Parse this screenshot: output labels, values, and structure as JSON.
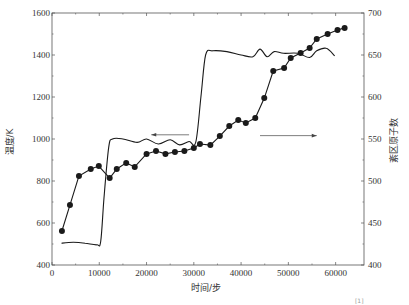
{
  "chart_data": {
    "type": "line",
    "title": "",
    "xlabel": "时间/步",
    "ylabel": "温度/K",
    "y2label": "紊区原子数",
    "xlim": [
      0,
      66000
    ],
    "ylim": [
      400,
      1600
    ],
    "y2lim": [
      400,
      700
    ],
    "x_ticks": [
      0,
      10000,
      20000,
      30000,
      40000,
      50000,
      60000
    ],
    "x_tick_labels": [
      "0",
      "10000",
      "20000",
      "30000",
      "40000",
      "50000",
      "60000"
    ],
    "y_ticks": [
      400,
      600,
      800,
      1000,
      1200,
      1400,
      1600
    ],
    "y_tick_labels": [
      "400",
      "600",
      "800",
      "1000",
      "1200",
      "1400",
      "1600"
    ],
    "y2_ticks": [
      400,
      450,
      500,
      550,
      600,
      650,
      700
    ],
    "y2_tick_labels": [
      "400",
      "450",
      "500",
      "550",
      "600",
      "650",
      "700"
    ],
    "grid": false,
    "legend": "none",
    "series": [
      {
        "name": "温度",
        "axis": "left",
        "style": "line-markers",
        "x": [
          2100,
          3800,
          5700,
          8200,
          9900,
          12200,
          13700,
          15700,
          17500,
          20000,
          22000,
          24000,
          26000,
          28000,
          30000,
          31300,
          33500,
          35500,
          37500,
          39400,
          41000,
          43000,
          44900,
          46800,
          49100,
          50500,
          52600,
          54500,
          56000,
          58300,
          60400,
          61900
        ],
        "values": [
          562,
          686,
          824,
          857,
          871,
          814,
          857,
          886,
          867,
          929,
          943,
          929,
          938,
          943,
          957,
          976,
          971,
          1014,
          1062,
          1090,
          1076,
          1100,
          1195,
          1324,
          1338,
          1386,
          1410,
          1433,
          1476,
          1500,
          1519,
          1529
        ]
      },
      {
        "name": "紊区原子数",
        "axis": "right",
        "style": "line",
        "x": [
          2000,
          4500,
          7000,
          9500,
          10300,
          11000,
          12000,
          12800,
          15000,
          18000,
          20000,
          22500,
          25000,
          27000,
          29000,
          30400,
          31500,
          32500,
          34000,
          37000,
          40000,
          42500,
          44000,
          45500,
          47000,
          49000,
          52000,
          54500,
          56000,
          58000,
          59800
        ],
        "values": [
          426,
          427,
          426,
          424,
          428,
          480,
          540,
          550,
          550,
          546,
          550,
          544,
          549,
          543,
          547,
          546,
          600,
          650,
          655,
          654,
          650,
          648,
          657,
          648,
          654,
          652,
          652,
          647,
          655,
          658,
          649
        ]
      }
    ],
    "annotations": [
      {
        "type": "arrow",
        "direction": "left",
        "from_x": 29000,
        "to_x": 21000,
        "y": 1020,
        "meaning": "temperature curve uses left axis"
      },
      {
        "type": "arrow",
        "direction": "right",
        "from_x": 44000,
        "to_x": 56000,
        "y": 1016,
        "meaning": "atom count curve uses right axis"
      }
    ]
  },
  "caption_fragment": "[1]"
}
